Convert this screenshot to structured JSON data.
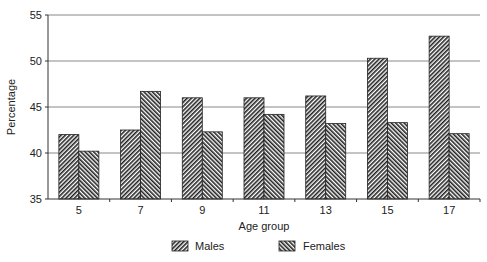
{
  "chart_data": {
    "type": "bar",
    "title": "",
    "xlabel": "Age group",
    "ylabel": "Percentage",
    "categories": [
      "5",
      "7",
      "9",
      "11",
      "13",
      "15",
      "17"
    ],
    "series": [
      {
        "name": "Males",
        "pattern": "diagonal-forward",
        "values": [
          42.0,
          42.5,
          46.0,
          46.0,
          46.2,
          50.3,
          52.7
        ]
      },
      {
        "name": "Females",
        "pattern": "diagonal-backward",
        "values": [
          40.2,
          46.7,
          42.3,
          44.2,
          43.2,
          43.3,
          42.1
        ]
      }
    ],
    "ylim": [
      35,
      55
    ],
    "yticks": [
      35,
      40,
      45,
      50,
      55
    ],
    "grid": true,
    "legend_position": "bottom"
  },
  "legend": {
    "males": "Males",
    "females": "Females"
  },
  "axes": {
    "xlabel": "Age group",
    "ylabel": "Percentage"
  }
}
